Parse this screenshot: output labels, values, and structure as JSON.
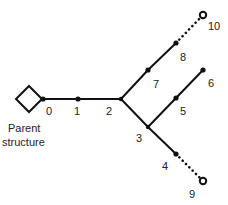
{
  "diagram": {
    "type": "branching-tree",
    "root": {
      "label_line1": "Parent",
      "label_line2": "structure",
      "shape": "diamond"
    },
    "nodes": [
      {
        "id": "0",
        "label": "0",
        "kind": "filled"
      },
      {
        "id": "1",
        "label": "1",
        "kind": "filled"
      },
      {
        "id": "2",
        "label": "2",
        "kind": "branch"
      },
      {
        "id": "3",
        "label": "3",
        "kind": "branch"
      },
      {
        "id": "4",
        "label": "4",
        "kind": "filled"
      },
      {
        "id": "5",
        "label": "5",
        "kind": "filled"
      },
      {
        "id": "6",
        "label": "6",
        "kind": "filled"
      },
      {
        "id": "7",
        "label": "7",
        "kind": "filled"
      },
      {
        "id": "8",
        "label": "8",
        "kind": "filled"
      },
      {
        "id": "9",
        "label": "9",
        "kind": "open"
      },
      {
        "id": "10",
        "label": "10",
        "kind": "open"
      }
    ],
    "edges": [
      {
        "from": "root",
        "to": "0",
        "style": "solid"
      },
      {
        "from": "0",
        "to": "1",
        "style": "solid"
      },
      {
        "from": "1",
        "to": "2",
        "style": "solid"
      },
      {
        "from": "2",
        "to": "7",
        "style": "solid"
      },
      {
        "from": "7",
        "to": "8",
        "style": "solid"
      },
      {
        "from": "8",
        "to": "10",
        "style": "dotted"
      },
      {
        "from": "2",
        "to": "3",
        "style": "solid"
      },
      {
        "from": "3",
        "to": "5",
        "style": "solid"
      },
      {
        "from": "5",
        "to": "6",
        "style": "solid"
      },
      {
        "from": "3",
        "to": "4",
        "style": "solid"
      },
      {
        "from": "4",
        "to": "9",
        "style": "dotted"
      }
    ]
  }
}
